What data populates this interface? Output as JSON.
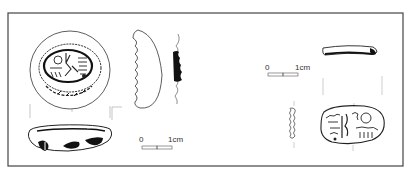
{
  "figure": {
    "colors": {
      "ink": "#222222",
      "frame": "#444444",
      "background": "#ffffff"
    }
  },
  "scale_bars": [
    {
      "id": "left",
      "start_label": "0",
      "end_label": "1cm"
    },
    {
      "id": "right",
      "start_label": "0",
      "end_label": "1cm"
    }
  ],
  "objects": [
    {
      "id": "scarab-1",
      "views": [
        "base-plan",
        "side-profile",
        "section",
        "back-view"
      ]
    },
    {
      "id": "scarab-2",
      "views": [
        "top-profile",
        "section",
        "base-plan"
      ]
    }
  ]
}
